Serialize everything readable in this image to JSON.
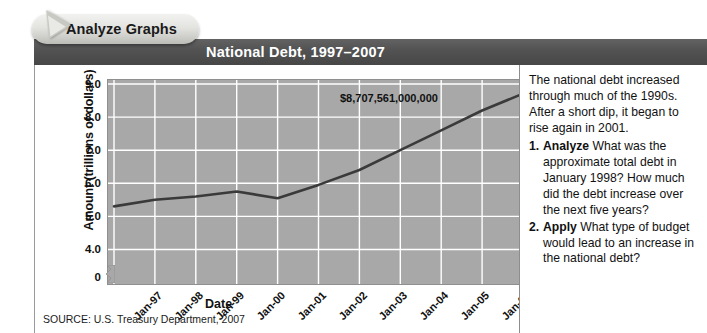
{
  "tab": {
    "label": "Analyze Graphs"
  },
  "banner": {
    "title": "National Debt, 1997–2007"
  },
  "chart_data": {
    "type": "line",
    "title": "National Debt, 1997–2007",
    "xlabel": "Date",
    "ylabel": "Amount (trillions of dollars)",
    "categories": [
      "Jan-97",
      "Jan-98",
      "Jan-99",
      "Jan-00",
      "Jan-01",
      "Jan-02",
      "Jan-03",
      "Jan-04",
      "Jan-05",
      "Jan-06",
      "Jan-07"
    ],
    "values": [
      5.3,
      5.5,
      5.6,
      5.75,
      5.55,
      5.95,
      6.4,
      7.0,
      7.6,
      8.2,
      8.71
    ],
    "ytick_labels": [
      "9.0",
      "8.0",
      "7.0",
      "6.0",
      "5.0",
      "4.0",
      "0"
    ],
    "ytick_values": [
      9.0,
      8.0,
      7.0,
      6.0,
      5.0,
      4.0,
      0
    ],
    "ylim": [
      3.5,
      9.0
    ],
    "axis_break": true,
    "grid": true,
    "legend": "none",
    "annotation": "$8,707,561,000,000",
    "annotation_point": "Jan-07",
    "line_color": "#3a3a3a",
    "plot_background": "#a8a8a8",
    "gridline_color": "#ffffff",
    "source": "SOURCE: U.S. Treasury Department, 2007"
  },
  "sidebar": {
    "intro": "The national debt increased through much of the 1990s. After a short dip, it began to rise again in 2001.",
    "questions": [
      {
        "number": "1.",
        "verb": "Analyze",
        "text": "What was the approximate total debt in January 1998? How much did the debt increase over the next five years?"
      },
      {
        "number": "2.",
        "verb": "Apply",
        "text": "What type of budget would lead to an increase in the national debt?"
      }
    ]
  }
}
